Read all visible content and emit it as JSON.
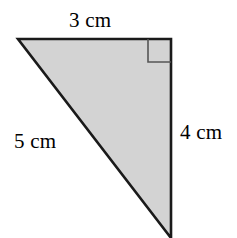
{
  "figure": {
    "kind": "right-triangle-diagram",
    "background_color": "#ffffff",
    "fill_color": "#d3d3d3",
    "stroke_color": "#1a1a1a",
    "labels": {
      "top_side": "3 cm",
      "right_side": "4 cm",
      "hypotenuse": "5 cm"
    },
    "right_angle_marker": {
      "present": true,
      "location": "top-right-vertex",
      "size_px": 23
    },
    "vertices": {
      "top_left": [
        18,
        39
      ],
      "top_right": [
        171,
        39
      ],
      "bottom": [
        171,
        238
      ]
    }
  },
  "chart_data": {
    "type": "diagram",
    "title": "",
    "shape": "right triangle",
    "sides": [
      {
        "name": "top-leg",
        "label": "3 cm",
        "value": 3,
        "unit": "cm",
        "orientation": "horizontal"
      },
      {
        "name": "right-leg",
        "label": "4 cm",
        "value": 4,
        "unit": "cm",
        "orientation": "vertical"
      },
      {
        "name": "hypotenuse",
        "label": "5 cm",
        "value": 5,
        "unit": "cm",
        "orientation": "diagonal"
      }
    ],
    "right_angle_at": "top-right",
    "annotations": [
      "3 cm",
      "4 cm",
      "5 cm"
    ]
  }
}
